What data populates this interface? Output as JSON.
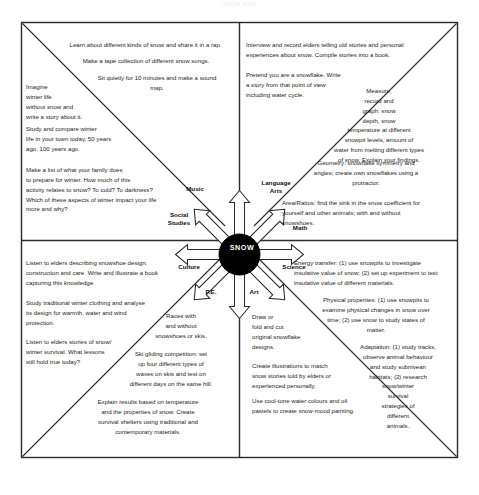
{
  "document": {
    "scan_header": "SNOW WEB",
    "hub_label": "SNOW"
  },
  "hub": {
    "spokes": [
      {
        "id": "music",
        "label": "Music"
      },
      {
        "id": "language-arts",
        "label": "Language\nArts"
      },
      {
        "id": "social-studies",
        "label": "Social\nStudies"
      },
      {
        "id": "math",
        "label": "Math"
      },
      {
        "id": "culture",
        "label": "Culture"
      },
      {
        "id": "science",
        "label": "Science"
      },
      {
        "id": "pe",
        "label": "P.E."
      },
      {
        "id": "art",
        "label": "Art"
      }
    ]
  },
  "quadrants": {
    "music_top_left": {
      "name": "Music",
      "activities": [
        "Learn about different kinds of snow and share it in a rap.",
        "Make a tape collection of different snow songs.",
        "Sit quietly for 10 minutes and make a sound\nmap."
      ]
    },
    "social_studies_left": {
      "name": "Social Studies",
      "activities": [
        "Imagine\nwinter life\nwithout snow and\n write a story about it.",
        "Study and compare winter\nlife in your town today, 50 years\nago, 100 years ago.",
        "Make a list of what your family does\nto prepare for winter. How much of this\nactivity relates to snow? To cold? To darkness?\nWhich of these aspects of winter impact your life\nmore and why?"
      ]
    },
    "language_arts_top_right": {
      "name": "Language Arts",
      "activities": [
        "Interview and record elders telling old stories and personal\nexperiences about snow. Compile stories into a book.",
        "Pretend you are a snowflake. Write\na story from that point of view\nincluding water cycle."
      ]
    },
    "math_right": {
      "name": "Math",
      "activities": [
        "Measure,\nrecord and\ngraph: snow\ndepth, snow\ntemperature at different\nsnowpit levels, amount of\nwater from melting different types\nof snow. Explain your findings.",
        "Geometry: snowflake symmetry and\nangles; create own snowflakes using a\nprotractor.",
        "Area/Ratios: find the sink in the snow coefficient for\nyourself and other animals; with and without\nsnowshoes."
      ]
    },
    "culture_bottom_left": {
      "name": "Culture",
      "activities": [
        "Listen to elders describing snowshoe design,\nconstruction and care. Write and illustrate a book\ncapturing this knowledge.",
        "Study traditional winter clothing and analyse\nits design for warmth, water and wind\nprotection.",
        "Listen to elders stories of snow/\nwinter survival. What lessons\nstill hold true today?"
      ]
    },
    "pe_bottom": {
      "name": "P.E.",
      "activities": [
        "Races with\nand without\nsnowshoes or skis.",
        "Ski gliding competition: set\nup four different types of\nwaxes on skis and test on\ndifferent days on the same hill.",
        "Explain results based on temperature\nand the properties of snow. Create\nsurvival shelters using traditional and\ncontemporary materials."
      ]
    },
    "art_bottom_right": {
      "name": "Art",
      "activities": [
        "Draw or\nfold and cut\noriginal snowflake\ndesigns.",
        "Create illustrations to match\nsnow stories told by elders or\nexperienced personally.",
        "Use cool-tone water colours and oil\npastels to create snow-mood painting."
      ]
    },
    "science_right": {
      "name": "Science",
      "activities": [
        "Energy transfer: (1) use snowpits to investigate\ninsulative value of snow; (2) set up experiment to test\ninsulative value of different materials.",
        "Physical properties: (1) use snowpits to\nexamine physical changes in snow over\ntime; (2) use snow to study states of\nmatter.",
        "Adaptation: (1) study tracks,\nobserve animal behaviour\nand study subnivean\nhabitats; (2) research\nsnow/winter\nsurvival\nstrategies of\ndifferent\nanimals."
      ]
    }
  },
  "colors": {
    "ink": "#1d1d1d",
    "hub_fill": "#000000",
    "hub_text": "#ffffff",
    "paper": "#ffffff"
  }
}
